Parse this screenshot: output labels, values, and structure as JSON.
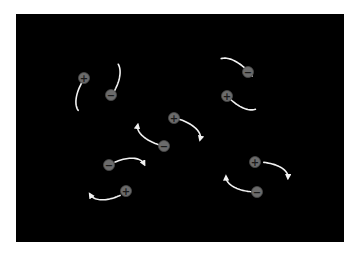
{
  "figure": {
    "background": "#000000",
    "orbit_color": "#f2f2f2",
    "charge_color": "#6b6b6b",
    "dipoles": [
      {
        "id": "top-left",
        "orbit": {
          "cx": 98,
          "cy": 87,
          "rx": 16,
          "ry": 31,
          "rotate": 35
        },
        "charges": [
          {
            "sign": "+",
            "x": 84,
            "y": 78
          },
          {
            "sign": "−",
            "x": 111,
            "y": 95
          }
        ]
      },
      {
        "id": "top-right",
        "orbit": {
          "cx": 238,
          "cy": 84,
          "rx": 16,
          "ry": 31,
          "rotate": -40
        },
        "charges": [
          {
            "sign": "−",
            "x": 248,
            "y": 72
          },
          {
            "sign": "+",
            "x": 227,
            "y": 96
          }
        ]
      },
      {
        "id": "center",
        "orbit": {
          "cx": 169,
          "cy": 132,
          "rx": 32,
          "ry": 15,
          "rotate": 12
        },
        "charges": [
          {
            "sign": "+",
            "x": 174,
            "y": 118
          },
          {
            "sign": "−",
            "x": 164,
            "y": 146
          }
        ]
      },
      {
        "id": "bottom-left",
        "orbit": {
          "cx": 117,
          "cy": 179,
          "rx": 31,
          "ry": 16,
          "rotate": -30
        },
        "charges": [
          {
            "sign": "−",
            "x": 109,
            "y": 165
          },
          {
            "sign": "+",
            "x": 126,
            "y": 191
          }
        ]
      },
      {
        "id": "bottom-right",
        "orbit": {
          "cx": 257,
          "cy": 177,
          "rx": 31,
          "ry": 15,
          "rotate": 0
        },
        "charges": [
          {
            "sign": "+",
            "x": 255,
            "y": 162
          },
          {
            "sign": "−",
            "x": 257,
            "y": 192
          }
        ]
      }
    ]
  }
}
